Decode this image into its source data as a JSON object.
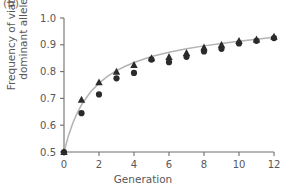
{
  "panel": {
    "label": "(b)"
  },
  "chart_data": {
    "type": "scatter",
    "title": "",
    "subtitle": "",
    "xlabel": "Generation",
    "ylabel": "Frequency of viable dominant allele",
    "ylabel_line1": "Frequency of viable",
    "ylabel_line2": "dominant allele",
    "xlim": [
      0,
      12
    ],
    "ylim": [
      0.5,
      1.0
    ],
    "xticks": [
      0,
      2,
      4,
      6,
      8,
      10,
      12
    ],
    "xticklabels": [
      "0",
      "2",
      "4",
      "6",
      "8",
      "10",
      "12"
    ],
    "yticks": [
      0.5,
      0.6,
      0.7,
      0.8,
      0.9,
      1.0
    ],
    "yticklabels": [
      "0.5",
      "0.6",
      "0.7",
      "0.8",
      "0.9",
      "1.0"
    ],
    "grid": false,
    "legend": "none",
    "colors": {
      "marker": "#2b2b2d",
      "curve": "#b3b3b3",
      "axis": "#6e6e70",
      "text": "#58585a",
      "background": "#ffffff"
    },
    "series": [
      {
        "name": "replicate-circles",
        "marker": "circle",
        "x": [
          0,
          1,
          2,
          3,
          4,
          5,
          6,
          7,
          8,
          9,
          10,
          11,
          12
        ],
        "y": [
          0.5,
          0.645,
          0.715,
          0.775,
          0.795,
          0.845,
          0.835,
          0.855,
          0.875,
          0.885,
          0.905,
          0.915,
          0.925
        ]
      },
      {
        "name": "replicate-triangles",
        "marker": "triangle",
        "x": [
          0,
          1,
          2,
          3,
          4,
          5,
          6,
          7,
          8,
          9,
          10,
          11,
          12
        ],
        "y": [
          0.5,
          0.695,
          0.76,
          0.8,
          0.825,
          0.85,
          0.855,
          0.87,
          0.89,
          0.9,
          0.915,
          0.92,
          0.93
        ]
      }
    ],
    "fit_curve": {
      "name": "fitted-trend",
      "x": [
        0,
        0.25,
        0.5,
        0.75,
        1,
        1.5,
        2,
        2.5,
        3,
        3.5,
        4,
        5,
        6,
        7,
        8,
        9,
        10,
        11,
        12
      ],
      "y": [
        0.5,
        0.56,
        0.607,
        0.645,
        0.676,
        0.723,
        0.757,
        0.783,
        0.804,
        0.82,
        0.834,
        0.856,
        0.872,
        0.885,
        0.896,
        0.905,
        0.913,
        0.921,
        0.928
      ]
    }
  }
}
